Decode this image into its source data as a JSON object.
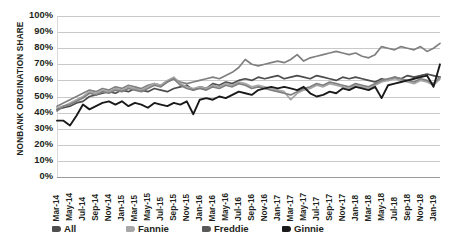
{
  "chart_data": {
    "type": "line",
    "title": "",
    "xlabel": "",
    "ylabel": "NONBANK ORIGINATION SHARE",
    "ylim": [
      0,
      100
    ],
    "ytick_labels": [
      "100%",
      "90%",
      "80%",
      "70%",
      "60%",
      "50%",
      "40%",
      "30%",
      "20%",
      "10%",
      "0%"
    ],
    "ytick_values": [
      100,
      90,
      80,
      70,
      60,
      50,
      40,
      30,
      20,
      10,
      0
    ],
    "grid": true,
    "legend_position": "bottom",
    "x_tick_labels": [
      "Mar-14",
      "May-14",
      "Jul-14",
      "Sep-14",
      "Nov-14",
      "Jan-15",
      "Mar-15",
      "May-15",
      "Jul-15",
      "Sep-15",
      "Nov-15",
      "Jan-16",
      "Mar-16",
      "May-16",
      "Jul-16",
      "Sep-16",
      "Nov-16",
      "Jan-17",
      "Mar-17",
      "May-17",
      "Jul-17",
      "Sep-17",
      "Nov-17",
      "Jan-18",
      "Mar-18",
      "May-18",
      "Jul-18",
      "Sep-18",
      "Nov-18",
      "Jan-19"
    ],
    "x_first": "Mar-14",
    "x_last": "Jan-19",
    "x_tick_interval_months": 2,
    "colors": {
      "All": "#4d4d4d",
      "Fannie": "#a6a6a6",
      "Freddie": "#808080",
      "Ginnie": "#1a1a1a"
    },
    "series": [
      {
        "name": "All",
        "color": "#4d4d4d",
        "values": [
          42,
          43,
          44,
          46,
          47,
          50,
          51,
          52,
          53,
          52,
          54,
          53,
          55,
          54,
          53,
          55,
          54,
          53,
          55,
          56,
          57,
          54,
          56,
          55,
          58,
          57,
          59,
          58,
          60,
          61,
          60,
          62,
          61,
          62,
          63,
          61,
          62,
          63,
          62,
          61,
          63,
          62,
          61,
          60,
          62,
          61,
          62,
          61,
          60,
          59,
          61,
          60,
          62,
          61,
          63,
          62,
          63,
          64,
          63,
          62
        ]
      },
      {
        "name": "Fannie",
        "color": "#a6a6a6",
        "values": [
          43,
          44,
          46,
          48,
          50,
          53,
          52,
          54,
          53,
          55,
          54,
          56,
          55,
          54,
          56,
          58,
          57,
          60,
          62,
          58,
          56,
          55,
          56,
          55,
          57,
          56,
          58,
          57,
          59,
          58,
          56,
          57,
          56,
          55,
          54,
          53,
          48,
          52,
          54,
          55,
          57,
          56,
          58,
          57,
          56,
          55,
          57,
          56,
          55,
          57,
          59,
          60,
          61,
          60,
          59,
          58,
          60,
          59,
          57,
          61
        ]
      },
      {
        "name": "Freddie",
        "color": "#808080",
        "values": [
          41,
          44,
          45,
          47,
          49,
          52,
          51,
          53,
          52,
          54,
          53,
          55,
          54,
          53,
          55,
          57,
          56,
          59,
          61,
          57,
          55,
          54,
          55,
          54,
          56,
          55,
          57,
          56,
          58,
          57,
          55,
          56,
          55,
          54,
          53,
          52,
          51,
          53,
          55,
          56,
          58,
          57,
          59,
          58,
          57,
          56,
          58,
          57,
          56,
          58,
          60,
          61,
          62,
          61,
          60,
          59,
          61,
          60,
          58,
          62
        ]
      },
      {
        "name": "Ginnie",
        "color": "#1a1a1a",
        "values": [
          35,
          35,
          32,
          38,
          45,
          42,
          44,
          46,
          47,
          45,
          47,
          44,
          46,
          45,
          43,
          46,
          45,
          44,
          46,
          45,
          47,
          39,
          48,
          49,
          48,
          50,
          49,
          51,
          53,
          52,
          51,
          54,
          55,
          56,
          55,
          56,
          55,
          54,
          56,
          52,
          50,
          51,
          53,
          52,
          55,
          54,
          56,
          55,
          54,
          56,
          49,
          57,
          58,
          59,
          60,
          61,
          62,
          63,
          56,
          70
        ]
      },
      {
        "name": "GinnieTop",
        "color": "#808080",
        "values": [
          44,
          46,
          48,
          50,
          52,
          54,
          53,
          55,
          54,
          56,
          55,
          57,
          56,
          55,
          57,
          58,
          57,
          59,
          61,
          59,
          58,
          59,
          60,
          61,
          62,
          61,
          63,
          65,
          68,
          73,
          70,
          69,
          70,
          71,
          72,
          71,
          73,
          76,
          72,
          74,
          75,
          76,
          77,
          78,
          77,
          76,
          77,
          75,
          74,
          76,
          81,
          80,
          79,
          81,
          80,
          79,
          81,
          78,
          80,
          83
        ]
      }
    ]
  },
  "legend": {
    "items": [
      {
        "label": "All",
        "color": "#4d4d4d"
      },
      {
        "label": "Fannie",
        "color": "#a6a6a6"
      },
      {
        "label": "Freddie",
        "color": "#595959"
      },
      {
        "label": "Ginnie",
        "color": "#1a1a1a"
      }
    ]
  },
  "axis": {
    "y_title": "NONBANK ORIGINATION SHARE"
  }
}
